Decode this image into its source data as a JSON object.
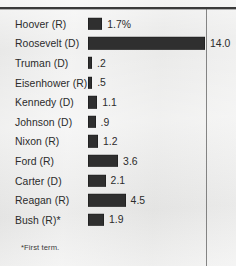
{
  "chart_data": {
    "type": "bar",
    "orientation": "horizontal",
    "title": "",
    "xlabel": "",
    "ylabel": "",
    "categories": [
      "Hoover (R)",
      "Roosevelt (D)",
      "Truman (D)",
      "Eisenhower (R)",
      "Kennedy (D)",
      "Johnson (D)",
      "Nixon (R)",
      "Ford (R)",
      "Carter (D)",
      "Reagan (R)",
      "Bush (R)*"
    ],
    "values": [
      1.7,
      14.0,
      0.2,
      0.5,
      1.1,
      0.9,
      1.2,
      3.6,
      2.1,
      4.5,
      1.9
    ],
    "value_labels": [
      "1.7%",
      "14.0",
      ".2",
      ".5",
      "1.1",
      ".9",
      "1.2",
      "3.6",
      "2.1",
      "4.5",
      "1.9"
    ],
    "xlim": [
      0,
      14.0
    ],
    "grid": false,
    "legend": null,
    "bar_color": "#2f2f2f",
    "background_color": "#ececeb",
    "text_color": "#2b2b2b",
    "annotations": [
      "*First term."
    ]
  },
  "rows": [
    {
      "label": "Hoover (R)",
      "value": 1.7,
      "value_label": "1.7%"
    },
    {
      "label": "Roosevelt (D)",
      "value": 14.0,
      "value_label": "14.0"
    },
    {
      "label": "Truman (D)",
      "value": 0.2,
      "value_label": ".2"
    },
    {
      "label": "Eisenhower (R)",
      "value": 0.5,
      "value_label": ".5"
    },
    {
      "label": "Kennedy (D)",
      "value": 1.1,
      "value_label": "1.1"
    },
    {
      "label": "Johnson (D)",
      "value": 0.9,
      "value_label": ".9"
    },
    {
      "label": "Nixon (R)",
      "value": 1.2,
      "value_label": "1.2"
    },
    {
      "label": "Ford (R)",
      "value": 3.6,
      "value_label": "3.6"
    },
    {
      "label": "Carter (D)",
      "value": 2.1,
      "value_label": "2.1"
    },
    {
      "label": "Reagan (R)",
      "value": 4.5,
      "value_label": "4.5"
    },
    {
      "label": "Bush (R)*",
      "value": 1.9,
      "value_label": "1.9"
    }
  ],
  "footnote": "*First term.",
  "scale": {
    "max_value": 14.0,
    "max_pixels": 117,
    "min_pixels": 4
  }
}
